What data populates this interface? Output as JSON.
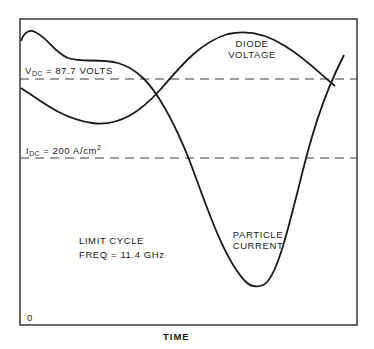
{
  "figure": {
    "frame": {
      "x": 20,
      "y": 19,
      "width": 337,
      "height": 306,
      "stroke": "#2a2a2a"
    },
    "colors": {
      "ink": "#1a1a1a",
      "background": "#ffffff",
      "frame": "#2a2a2a",
      "dash": "#3a3a3a"
    },
    "reference_lines": [
      {
        "id": "vdc",
        "y": 79,
        "label_main": "V",
        "label_sub": "DC",
        "label_rest": " = 87.7  VOLTS"
      },
      {
        "id": "idc",
        "y": 158,
        "label_main": "I",
        "label_sub": "DC",
        "label_rest": " = 200  A/cm",
        "label_sup": "2"
      }
    ],
    "curves": [
      {
        "id": "diode-voltage",
        "label_lines": [
          "DIODE",
          "VOLTAGE"
        ]
      },
      {
        "id": "particle-current",
        "label_lines": [
          "PARTICLE",
          "CURRENT"
        ]
      }
    ],
    "annotation": {
      "line1": "LIMIT CYCLE",
      "line2": "FREQ = 11.4 GHz"
    },
    "origin_label": "0",
    "x_axis_label": "TIME"
  }
}
